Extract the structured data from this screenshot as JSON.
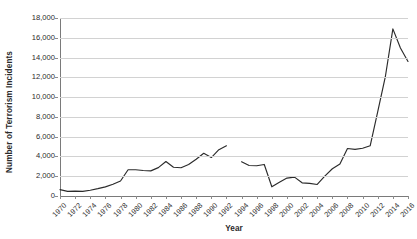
{
  "chart_data": {
    "type": "line",
    "title": "",
    "xlabel": "Year",
    "ylabel": "Number of Terrorism Incidents",
    "grid": true,
    "legend": false,
    "xlim": [
      1970,
      2016
    ],
    "ylim": [
      0,
      18000
    ],
    "ytick_interval": 2000,
    "xtick_interval": 2,
    "line_color": "#2b2b2b",
    "gridline_color": "#d2d2d2",
    "axis_color": "#7a7a7a",
    "note": "1993 data missing — line is broken between 1992 and 1994",
    "ytick_labels": [
      "0",
      "2,000",
      "4,000",
      "6,000",
      "8,000",
      "10,000",
      "12,000",
      "14,000",
      "16,000",
      "18,000"
    ],
    "ytick_values": [
      0,
      2000,
      4000,
      6000,
      8000,
      10000,
      12000,
      14000,
      16000,
      18000
    ],
    "xtick_labels": [
      "1970",
      "1972",
      "1974",
      "1976",
      "1978",
      "1980",
      "1982",
      "1984",
      "1986",
      "1988",
      "1990",
      "1992",
      "1994",
      "1996",
      "1998",
      "2000",
      "2002",
      "2004",
      "2006",
      "2008",
      "2010",
      "2012",
      "2014",
      "2016"
    ],
    "xtick_values": [
      1970,
      1972,
      1974,
      1976,
      1978,
      1980,
      1982,
      1984,
      1986,
      1988,
      1990,
      1992,
      1994,
      1996,
      1998,
      2000,
      2002,
      2004,
      2006,
      2008,
      2010,
      2012,
      2014,
      2016
    ],
    "x": [
      1970,
      1971,
      1972,
      1973,
      1974,
      1975,
      1976,
      1977,
      1978,
      1979,
      1980,
      1981,
      1982,
      1983,
      1984,
      1985,
      1986,
      1987,
      1988,
      1989,
      1990,
      1991,
      1992,
      1993,
      1994,
      1995,
      1996,
      1997,
      1998,
      1999,
      2000,
      2001,
      2002,
      2003,
      2004,
      2005,
      2006,
      2007,
      2008,
      2009,
      2010,
      2011,
      2012,
      2013,
      2014,
      2015,
      2016
    ],
    "values": [
      650,
      470,
      490,
      470,
      580,
      740,
      920,
      1180,
      1520,
      2660,
      2660,
      2580,
      2540,
      2870,
      3490,
      2910,
      2860,
      3180,
      3720,
      4320,
      3890,
      4680,
      5070,
      null,
      3460,
      3080,
      3060,
      3190,
      930,
      1390,
      1814,
      1907,
      1333,
      1278,
      1166,
      2017,
      2758,
      3242,
      4805,
      4721,
      4826,
      5076,
      8522,
      12036,
      16903,
      14965,
      13600
    ],
    "series_name": "Terrorism incidents"
  }
}
